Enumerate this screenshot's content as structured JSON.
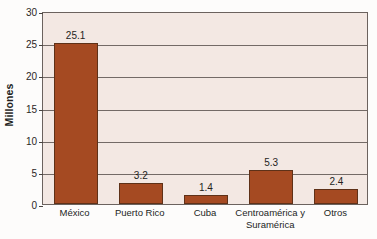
{
  "chart_data": {
    "type": "bar",
    "title": "",
    "xlabel": "",
    "ylabel": "Millones",
    "ylim": [
      0,
      30
    ],
    "grid": true,
    "legend": "none",
    "categories": [
      "México",
      "Puerto Rico",
      "Cuba",
      "Centroamérica y Suramérica",
      "Otros"
    ],
    "values": [
      25.1,
      3.2,
      1.4,
      5.3,
      2.4
    ],
    "value_labels": [
      "25.1",
      "3.2",
      "1.4",
      "5.3",
      "2.4"
    ],
    "ticks": [
      "30",
      "25",
      "20",
      "15",
      "10",
      "5",
      "0"
    ],
    "tick_values": [
      30,
      25,
      20,
      15,
      10,
      5,
      0
    ],
    "colors": {
      "bar_fill": "#a54a22",
      "bar_border": "#5e3118",
      "plot_background": "#f3e8e3",
      "plot_border": "#6b625e",
      "gridline": "#736a66",
      "page_background": "#fdfcfb",
      "text": "#231f1d"
    }
  }
}
